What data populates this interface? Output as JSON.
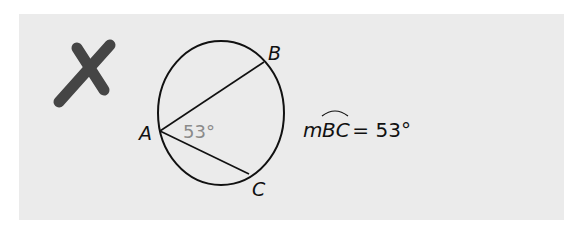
{
  "figure": {
    "mark": "incorrect-x",
    "points": {
      "A": "A",
      "B": "B",
      "C": "C"
    },
    "inscribed_angle_label": "53°",
    "equation": {
      "prefix": "m",
      "arc": "BC",
      "rest": " = 53°"
    },
    "colors": {
      "background": "#ebebeb",
      "x_mark": "#454545",
      "angle_label": "#8a8a8a",
      "stroke": "#111111"
    }
  }
}
